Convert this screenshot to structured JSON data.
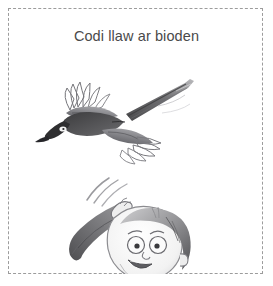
{
  "card": {
    "title": "Codi llaw ar bioden",
    "language": "Welsh",
    "background_color": "#ffffff",
    "title_color": "#4a4a4a",
    "border": {
      "style": "dashed",
      "color": "#9c9c9c",
      "name": "cut-out-dashed-border"
    }
  },
  "illustration": {
    "medium": "pencil sketch",
    "ink_color": "#58585a",
    "shadow_color": "#8e8e90",
    "light_color": "#c9c9cb",
    "dark_color": "#3a3a3c",
    "bird": {
      "name": "magpie",
      "welsh_name": "bioden",
      "action": "flying",
      "direction": "left",
      "parts": [
        "head",
        "beak",
        "eye",
        "upper-wing",
        "lower-wing",
        "body",
        "long-tail"
      ]
    },
    "boy": {
      "name": "boy",
      "action": "waving hand",
      "expression": "smiling",
      "parts": [
        "head",
        "hair",
        "eyes",
        "eyebrows",
        "nose",
        "mouth",
        "ear",
        "raised-arm",
        "hand",
        "shoulder",
        "torso"
      ],
      "motion_lines": 3
    }
  }
}
